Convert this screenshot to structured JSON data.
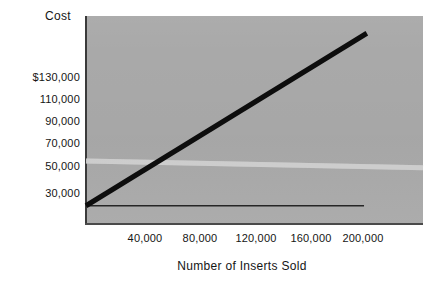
{
  "chart_data": {
    "type": "line",
    "title": "",
    "xlabel": "Number of Inserts Sold",
    "ylabel": "Cost",
    "ylabel_position": "top-left",
    "grid": false,
    "legend": "none",
    "background": "#a9a9a9",
    "xlim": [
      0,
      240000
    ],
    "ylim": [
      20000,
      140000
    ],
    "xticks": [
      40000,
      80000,
      120000,
      160000,
      200000
    ],
    "xtick_labels": [
      "40,000",
      "80,000",
      "120,000",
      "160,000",
      "200,000"
    ],
    "yticks": [
      130000,
      110000,
      90000,
      70000,
      50000,
      30000
    ],
    "ytick_labels": [
      "$130,000",
      "110,000",
      "90,000",
      "70,000",
      "50,000",
      "30,000"
    ],
    "series": [
      {
        "name": "total-cost-line",
        "style": "thick-solid-black",
        "color": "#0d0d0d",
        "width": 5,
        "x": [
          0,
          200000
        ],
        "values": [
          30000,
          130000
        ]
      },
      {
        "name": "fixed-cost-line",
        "style": "thin-solid-black",
        "color": "#262626",
        "width": 1.4,
        "x": [
          0,
          198000
        ],
        "values": [
          30000,
          30000
        ]
      },
      {
        "name": "light-horizontal-band",
        "style": "faint-light-band",
        "color": "#d0d0d0",
        "width": 5,
        "x": [
          0,
          240000
        ],
        "values": [
          56000,
          52000
        ]
      }
    ]
  },
  "axes": {
    "cost_label": "Cost",
    "x_title": "Number of Inserts Sold",
    "y_tick_labels": [
      "$130,000",
      "110,000",
      "90,000",
      "70,000",
      "50,000",
      "30,000"
    ],
    "x_tick_labels": [
      "40,000",
      "80,000",
      "120,000",
      "160,000",
      "200,000"
    ]
  },
  "colors": {
    "plot_background": "#a9a9a9",
    "page_background": "#ffffff",
    "axis": "#3a3a3a",
    "total_cost_line": "#0d0d0d",
    "fixed_cost_line": "#262626",
    "band": "#d0d0d0",
    "text": "#151515"
  }
}
